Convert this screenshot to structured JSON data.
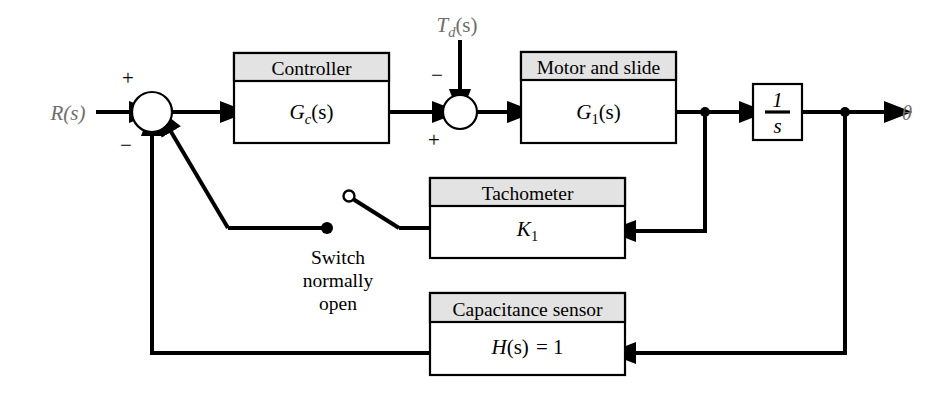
{
  "diagram": {
    "colors": {
      "line": "#000000",
      "header_fill": "#e3e3e3",
      "block_fill": "#ffffff",
      "io_label": "#6d6d6d",
      "background": "#ffffff"
    },
    "signals": {
      "input_label": "R(s)",
      "disturbance_label_main": "T",
      "disturbance_label_sub": "d",
      "disturbance_label_tail": "(s)",
      "output_label": "θ"
    },
    "blocks": [
      {
        "id": "controller",
        "header": "Controller",
        "body_main": "G",
        "body_sub": "c",
        "body_tail": "(s)"
      },
      {
        "id": "motor-and-slide",
        "header": "Motor and slide",
        "body_main": "G",
        "body_sub": "1",
        "body_tail": "(s)"
      },
      {
        "id": "integrator",
        "header": "",
        "body_numerator": "1",
        "body_denominator": "s"
      },
      {
        "id": "tachometer",
        "header": "Tachometer",
        "body_main": "K",
        "body_sub": "1",
        "body_tail": ""
      },
      {
        "id": "capacitance-sensor",
        "header": "Capacitance sensor",
        "body_main": "H",
        "body_tail": "(s)",
        "body_equals": "= 1"
      }
    ],
    "summing_junctions": [
      {
        "id": "error-junction",
        "sign_input": "+",
        "sign_feedback": "−"
      },
      {
        "id": "disturbance-junction",
        "sign_top": "−",
        "sign_left": "+"
      }
    ],
    "switch": {
      "note_line1": "Switch",
      "note_line2": "normally",
      "note_line3": "open",
      "state": "open"
    }
  }
}
